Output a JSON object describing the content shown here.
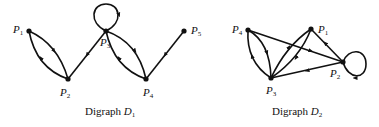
{
  "diagrams": [
    {
      "caption": {
        "text": "Digraph ",
        "symbol": "D",
        "sub": "1"
      },
      "nodes": [
        {
          "id": "P1",
          "label": "P",
          "sub": "1"
        },
        {
          "id": "P2",
          "label": "P",
          "sub": "2"
        },
        {
          "id": "P3",
          "label": "P",
          "sub": "3"
        },
        {
          "id": "P4",
          "label": "P",
          "sub": "4"
        },
        {
          "id": "P5",
          "label": "P",
          "sub": "5"
        }
      ],
      "edges": [
        {
          "from": "P1",
          "to": "P2"
        },
        {
          "from": "P2",
          "to": "P1"
        },
        {
          "from": "P3",
          "to": "P2"
        },
        {
          "from": "P3",
          "to": "P3"
        },
        {
          "from": "P3",
          "to": "P4"
        },
        {
          "from": "P4",
          "to": "P3"
        },
        {
          "from": "P5",
          "to": "P4"
        }
      ]
    },
    {
      "caption": {
        "text": "Digraph ",
        "symbol": "D",
        "sub": "2"
      },
      "nodes": [
        {
          "id": "P1",
          "label": "P",
          "sub": "1"
        },
        {
          "id": "P2",
          "label": "P",
          "sub": "2"
        },
        {
          "id": "P3",
          "label": "P",
          "sub": "3"
        },
        {
          "id": "P4",
          "label": "P",
          "sub": "4"
        }
      ],
      "edges": [
        {
          "from": "P3",
          "to": "P4"
        },
        {
          "from": "P4",
          "to": "P3"
        },
        {
          "from": "P4",
          "to": "P2"
        },
        {
          "from": "P3",
          "to": "P1"
        },
        {
          "from": "P1",
          "to": "P3"
        },
        {
          "from": "P2",
          "to": "P1"
        },
        {
          "from": "P2",
          "to": "P3"
        },
        {
          "from": "P2",
          "to": "P2"
        }
      ]
    }
  ]
}
